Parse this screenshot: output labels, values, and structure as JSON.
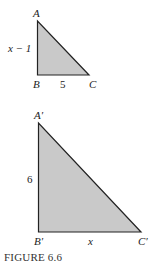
{
  "figure": {
    "caption": "FIGURE 6.6",
    "fill_color": "#c9c9c9",
    "stroke_color": "#222222"
  },
  "triangle_small": {
    "vertices": {
      "A": "A",
      "B": "B",
      "C": "C"
    },
    "side_AB_label": "x − 1",
    "side_BC_label": "5"
  },
  "triangle_large": {
    "vertices": {
      "A": "A′",
      "B": "B′",
      "C": "C′"
    },
    "side_AB_label": "6",
    "side_BC_label": "x"
  }
}
